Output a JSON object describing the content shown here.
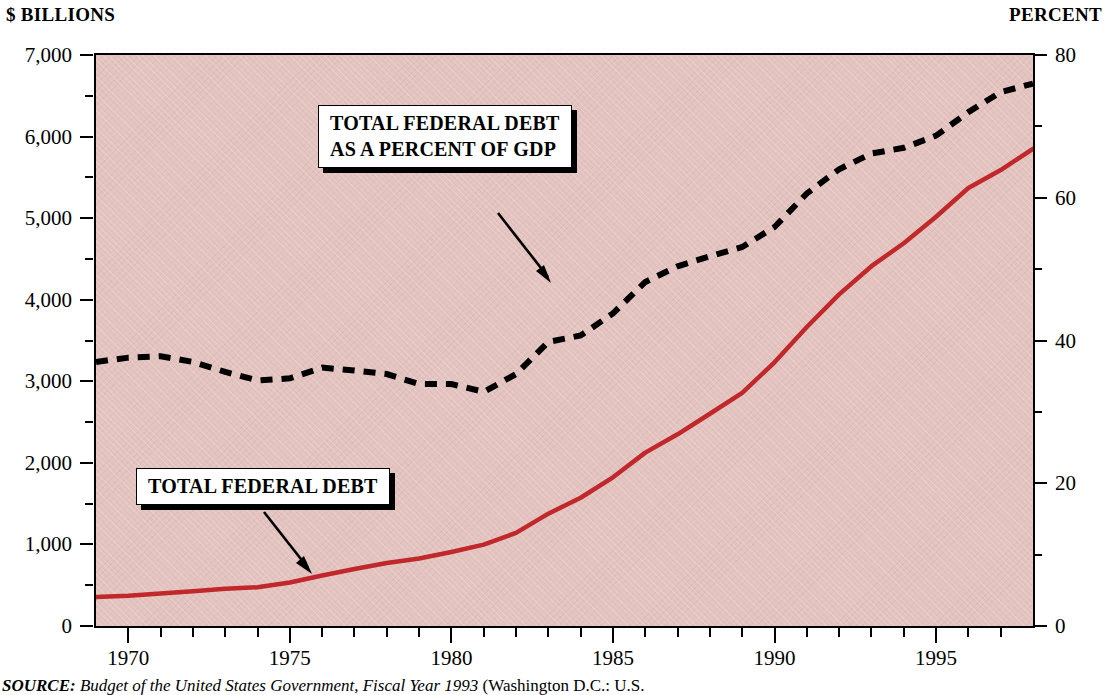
{
  "axes": {
    "left_unit_label": "$ BILLIONS",
    "right_unit_label": "PERCENT",
    "left_ticks": [
      "0",
      "1,000",
      "2,000",
      "3,000",
      "4,000",
      "5,000",
      "6,000",
      "7,000"
    ],
    "right_ticks": [
      "0",
      "20",
      "40",
      "60",
      "80"
    ],
    "x_ticks": [
      "1970",
      "1975",
      "1980",
      "1985",
      "1990",
      "1995"
    ]
  },
  "callouts": {
    "gdp_line1": "TOTAL FEDERAL DEBT",
    "gdp_line2": "AS A PERCENT OF GDP",
    "debt": "TOTAL FEDERAL DEBT"
  },
  "source": {
    "prefix": "SOURCE:",
    "italic_title": "Budget of the United States Government, Fiscal Year 1993",
    "suffix": "(Washington D.C.: U.S."
  },
  "colors": {
    "plot_background": "#e3c3bf",
    "debt_line": "#c0282c",
    "gdp_line": "#000000",
    "axis": "#000000"
  },
  "chart_data": {
    "type": "line",
    "title": "",
    "xlabel": "",
    "ylabel": "$ BILLIONS",
    "y2label": "PERCENT",
    "xlim": [
      1969,
      1998
    ],
    "ylim": [
      0,
      7000
    ],
    "y2lim": [
      0,
      80
    ],
    "grid": false,
    "legend": "annotated callouts with arrows",
    "x": [
      1969,
      1970,
      1971,
      1972,
      1973,
      1974,
      1975,
      1976,
      1977,
      1978,
      1979,
      1980,
      1981,
      1982,
      1983,
      1984,
      1985,
      1986,
      1987,
      1988,
      1989,
      1990,
      1991,
      1992,
      1993,
      1994,
      1995,
      1996,
      1997,
      1998
    ],
    "series": [
      {
        "name": "TOTAL FEDERAL DEBT",
        "axis": "left",
        "units": "$ billions",
        "style": "solid",
        "color": "#c0282c",
        "values": [
          355,
          372,
          398,
          427,
          458,
          475,
          533,
          620,
          699,
          772,
          827,
          908,
          998,
          1142,
          1377,
          1572,
          1823,
          2125,
          2350,
          2602,
          2857,
          3233,
          3665,
          4065,
          4411,
          4692,
          5017,
          5369,
          5590,
          5850
        ]
      },
      {
        "name": "TOTAL FEDERAL DEBT AS A PERCENT OF GDP",
        "axis": "right",
        "units": "percent of GDP",
        "style": "dotted",
        "color": "#000000",
        "values": [
          37.0,
          37.6,
          37.8,
          37.0,
          35.6,
          34.4,
          34.7,
          36.2,
          35.8,
          35.3,
          33.9,
          33.9,
          32.8,
          35.3,
          39.8,
          40.7,
          43.8,
          48.2,
          50.4,
          51.8,
          53.1,
          55.9,
          60.6,
          64.0,
          66.2,
          67.0,
          68.7,
          72.0,
          74.8,
          76.0
        ]
      }
    ],
    "annotations": [
      {
        "text": "TOTAL FEDERAL DEBT AS A PERCENT OF GDP",
        "points_to_series": "gdp-percent",
        "points_to_x": 1986
      },
      {
        "text": "TOTAL FEDERAL DEBT",
        "points_to_series": "federal-debt",
        "points_to_x": 1979
      }
    ]
  }
}
